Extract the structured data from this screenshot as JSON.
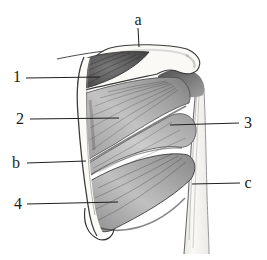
{
  "figure": {
    "paper_color": "#ffffff",
    "ink_color": "#2b2b2b",
    "labels": {
      "a": "a",
      "n1": "1",
      "n2": "2",
      "n3": "3",
      "b": "b",
      "n4": "4",
      "c": "c"
    }
  }
}
